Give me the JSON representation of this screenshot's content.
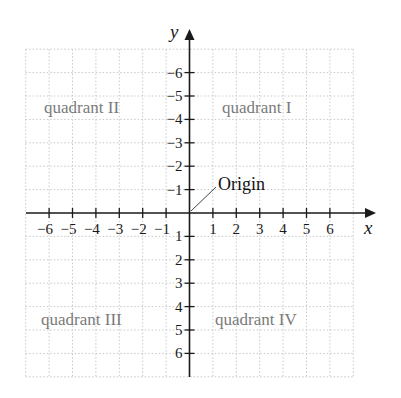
{
  "figure": {
    "x_axis_label": "x",
    "y_axis_label": "y",
    "origin_label": "Origin",
    "quadrants": {
      "I": "quadrant I",
      "II": "quadrant II",
      "III": "quadrant III",
      "IV": "quadrant IV"
    },
    "x_ticks": [
      "−6",
      "−5",
      "−4",
      "−3",
      "−2",
      "−1",
      "1",
      "2",
      "3",
      "4",
      "5",
      "6"
    ],
    "y_ticks": [
      "6",
      "5",
      "4",
      "3",
      "2",
      "1",
      "−1",
      "−2",
      "−3",
      "−4",
      "−5",
      "−6"
    ]
  },
  "colors": {
    "axis": "#1a1a1a",
    "grid": "#c8c8c8",
    "quadrant_text": "#7a7a7a"
  },
  "chart_data": {
    "type": "scatter",
    "title": "",
    "xlabel": "x",
    "ylabel": "y",
    "xlim": [
      -7,
      7
    ],
    "ylim": [
      -7,
      7
    ],
    "grid": true,
    "x_tick_values": [
      -6,
      -5,
      -4,
      -3,
      -2,
      -1,
      1,
      2,
      3,
      4,
      5,
      6
    ],
    "y_tick_values": [
      -6,
      -5,
      -4,
      -3,
      -2,
      -1,
      1,
      2,
      3,
      4,
      5,
      6
    ],
    "annotations": [
      {
        "text": "Origin",
        "points_to": [
          0,
          0
        ]
      },
      {
        "text": "quadrant I",
        "region": "x>0, y>0"
      },
      {
        "text": "quadrant II",
        "region": "x<0, y>0"
      },
      {
        "text": "quadrant III",
        "region": "x<0, y<0"
      },
      {
        "text": "quadrant IV",
        "region": "x>0, y<0"
      }
    ],
    "series": []
  }
}
